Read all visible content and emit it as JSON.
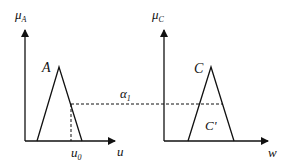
{
  "diagram": {
    "left_plot": {
      "y_axis_label": "μ",
      "y_axis_subscript": "A",
      "x_axis_label": "u",
      "fuzzy_set_label": "A",
      "input_value_label": "u",
      "input_value_subscript": "0"
    },
    "right_plot": {
      "y_axis_label": "μ",
      "y_axis_subscript": "C",
      "x_axis_label": "w",
      "fuzzy_set_label": "C",
      "clipped_set_label": "C'"
    },
    "alpha_cut": {
      "label": "α",
      "subscript": "1"
    },
    "colors": {
      "line": "#111111",
      "background": "#ffffff"
    }
  }
}
